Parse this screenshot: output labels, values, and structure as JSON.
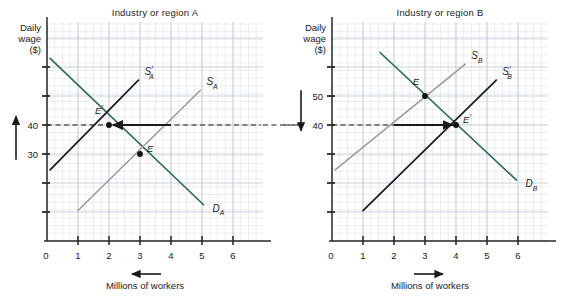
{
  "figure": {
    "background": "#ffffff",
    "grid_minor_color": "#dfe3ea",
    "grid_major_color": "#c3c9d4",
    "axis_color": "#2b2b2b",
    "demand_color": "#2f6b5c",
    "supply_old_color": "#9a9a9a",
    "supply_new_color": "#1a1a1a",
    "arrow_color": "#1a1a1a"
  },
  "panels": [
    {
      "id": "A",
      "title": "Industry or region A",
      "y_axis": {
        "label_lines": [
          "Daily",
          "wage",
          "($)"
        ],
        "tick_values": [
          30,
          40
        ],
        "tick_labels": [
          "30",
          "40"
        ],
        "unlabeled_ticks": [
          10,
          20,
          50,
          60
        ]
      },
      "x_axis": {
        "label": "Millions of workers",
        "origin_label": "0",
        "tick_labels": [
          "1",
          "2",
          "3",
          "4",
          "5",
          "6"
        ],
        "tick_values": [
          1,
          2,
          3,
          4,
          5,
          6
        ],
        "direction_arrow": "left"
      },
      "wage_arrow_direction": "up",
      "curves": [
        {
          "name": "D_A",
          "label_base": "D",
          "label_sub": "A",
          "label_prime": "",
          "role": "demand",
          "color_ref": "demand_color",
          "from": [
            0.1,
            63
          ],
          "to": [
            5.05,
            12.5
          ]
        },
        {
          "name": "S_A",
          "label_base": "S",
          "label_sub": "A",
          "label_prime": "",
          "role": "supply-old",
          "color_ref": "supply_old_color",
          "from": [
            1.0,
            10.5
          ],
          "to": [
            4.95,
            52
          ]
        },
        {
          "name": "S'_A",
          "label_base": "S",
          "label_sub": "A",
          "label_prime": "′",
          "role": "supply-new",
          "color_ref": "supply_new_color",
          "from": [
            0.1,
            24.5
          ],
          "to": [
            2.95,
            55.5
          ]
        }
      ],
      "points": [
        {
          "label": "E",
          "prime": "",
          "x": 3,
          "y": 30,
          "label_dx": 7,
          "label_dy": -2
        },
        {
          "label": "E",
          "prime": "′",
          "x": 2,
          "y": 40,
          "label_dx": -6,
          "label_dy": -11
        }
      ],
      "flow_arrow": {
        "from_x": 4.0,
        "to_x": 2.12,
        "y": 40,
        "direction": "left"
      },
      "dashed_wage_line": {
        "y": 40,
        "from_x": 0,
        "to_x": 6.9
      }
    },
    {
      "id": "B",
      "title": "Industry or region B",
      "y_axis": {
        "label_lines": [
          "Daily",
          "wage",
          "($)"
        ],
        "tick_values": [
          40,
          50
        ],
        "tick_labels": [
          "40",
          "50"
        ],
        "unlabeled_ticks": [
          10,
          20,
          30,
          60
        ]
      },
      "x_axis": {
        "label": "Millions of workers",
        "origin_label": "0",
        "tick_labels": [
          "1",
          "2",
          "3",
          "4",
          "5",
          "6"
        ],
        "tick_values": [
          1,
          2,
          3,
          4,
          5,
          6
        ],
        "direction_arrow": "right"
      },
      "wage_arrow_direction": "down",
      "curves": [
        {
          "name": "D_B",
          "label_base": "D",
          "label_sub": "B",
          "label_prime": "",
          "role": "demand",
          "color_ref": "demand_color",
          "from": [
            1.55,
            65
          ],
          "to": [
            5.95,
            21
          ]
        },
        {
          "name": "S_B",
          "label_base": "S",
          "label_sub": "B",
          "label_prime": "",
          "role": "supply-old",
          "color_ref": "supply_old_color",
          "from": [
            0.1,
            24.5
          ],
          "to": [
            4.3,
            61
          ]
        },
        {
          "name": "S'_B",
          "label_base": "S",
          "label_sub": "B",
          "label_prime": "′",
          "role": "supply-new",
          "color_ref": "supply_new_color",
          "from": [
            1.0,
            10.5
          ],
          "to": [
            5.3,
            55.5
          ]
        }
      ],
      "points": [
        {
          "label": "E",
          "prime": "",
          "x": 3,
          "y": 50,
          "label_dx": -6,
          "label_dy": -11
        },
        {
          "label": "E",
          "prime": "′",
          "x": 4,
          "y": 40,
          "label_dx": 7,
          "label_dy": -2
        }
      ],
      "flow_arrow": {
        "from_x": 2.0,
        "to_x": 3.9,
        "y": 40,
        "direction": "right"
      },
      "dashed_wage_line": {
        "y": 40,
        "from_x": 0,
        "to_x": 4.0
      }
    }
  ],
  "connector": {
    "dashes_between_panels": true,
    "y": 40
  }
}
